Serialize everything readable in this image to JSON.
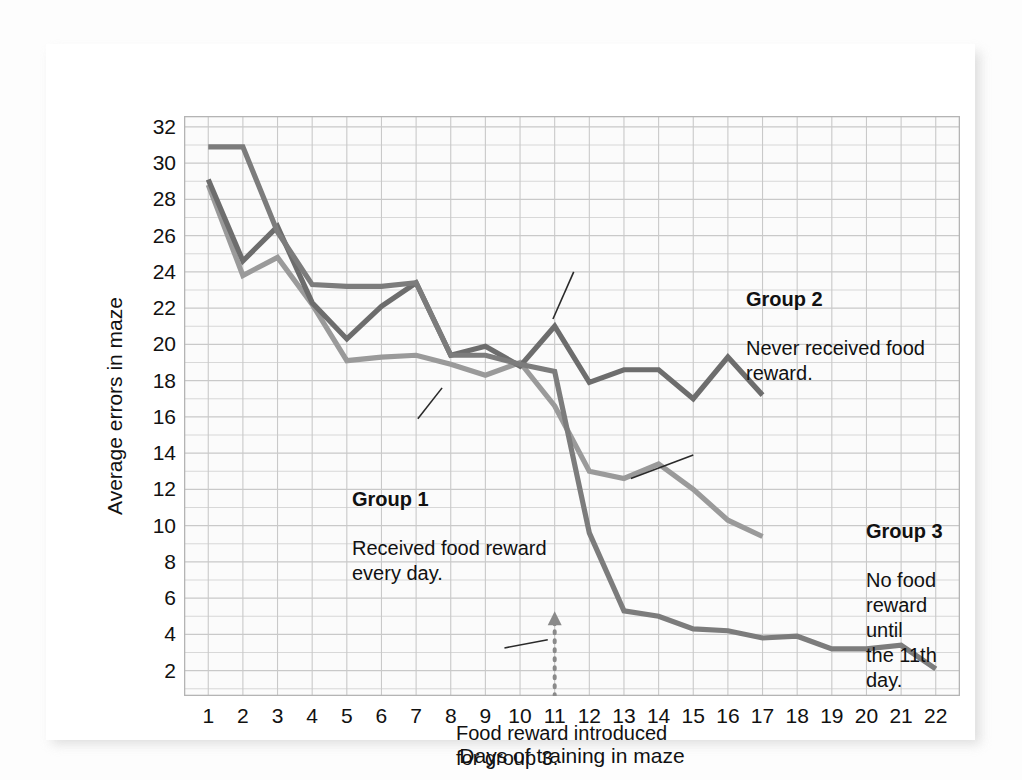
{
  "chart_data": {
    "type": "line",
    "title": "",
    "xlabel": "Days of training in maze",
    "ylabel": "Average errors in maze",
    "xlim": [
      0.3,
      22.7
    ],
    "ylim": [
      0.6,
      32.6
    ],
    "grid": true,
    "legend_position": "inline-annotations",
    "y_ticks": [
      32,
      30,
      28,
      26,
      24,
      22,
      20,
      18,
      16,
      14,
      12,
      10,
      8,
      6,
      4,
      2
    ],
    "x_ticks": [
      1,
      2,
      3,
      4,
      5,
      6,
      7,
      8,
      9,
      10,
      11,
      12,
      13,
      14,
      15,
      16,
      17,
      18,
      19,
      20,
      21,
      22
    ],
    "series": [
      {
        "name": "Group 1",
        "color": "#9a9a9a",
        "x": [
          1,
          2,
          3,
          4,
          5,
          6,
          7,
          8,
          9,
          10,
          11,
          12,
          13,
          14,
          15,
          16,
          17
        ],
        "values": [
          28.8,
          23.8,
          24.8,
          22.2,
          19.1,
          19.3,
          19.4,
          18.9,
          18.3,
          19.0,
          16.6,
          13.0,
          12.6,
          13.4,
          12.0,
          10.3,
          9.4
        ]
      },
      {
        "name": "Group 2",
        "color": "#6d6d6d",
        "x": [
          1,
          2,
          3,
          4,
          5,
          6,
          7,
          8,
          9,
          10,
          11,
          12,
          13,
          14,
          15,
          16,
          17
        ],
        "values": [
          29.1,
          24.6,
          26.5,
          22.3,
          20.3,
          22.1,
          23.4,
          19.4,
          19.9,
          18.8,
          21.0,
          17.9,
          18.6,
          18.6,
          17.0,
          19.3,
          17.2
        ]
      },
      {
        "name": "Group 3",
        "color": "#7c7c7c",
        "x": [
          1,
          2,
          3,
          4,
          5,
          6,
          7,
          8,
          9,
          10,
          11,
          12,
          13,
          14,
          15,
          16,
          17,
          18,
          19,
          20,
          21,
          22
        ],
        "values": [
          30.9,
          30.9,
          26.2,
          23.3,
          23.2,
          23.2,
          23.4,
          19.4,
          19.4,
          18.9,
          18.5,
          9.6,
          5.3,
          5.0,
          4.3,
          4.2,
          3.8,
          3.9,
          3.2,
          3.2,
          3.4,
          2.1
        ]
      }
    ],
    "annotations": [
      {
        "id": "group1",
        "title": "Group 1",
        "body": "Received food reward\nevery day."
      },
      {
        "id": "group2",
        "title": "Group 2",
        "body": "Never received food\nreward."
      },
      {
        "id": "group3",
        "title": "Group 3",
        "body": "No food reward until\nthe 11th day."
      },
      {
        "id": "food-reward",
        "title": "",
        "body": "Food reward introduced\nfor group 3."
      }
    ],
    "marker_day": 11,
    "marker_style": "dotted-vertical-arrow"
  },
  "colors": {
    "grid": "#c9c9c9",
    "plot_background": "#fbfbfb",
    "card_background": "#ffffff",
    "text": "#111111",
    "group1": "#9a9a9a",
    "group2": "#6d6d6d",
    "group3": "#7c7c7c",
    "marker": "#8a8a8a"
  },
  "axis": {
    "y_title": "Average errors in maze",
    "x_title": "Days of training in maze"
  },
  "annotations_text": {
    "g1_title": "Group 1",
    "g1_body": "Received food reward\nevery day.",
    "g2_title": "Group 2",
    "g2_body": "Never received food\nreward.",
    "g3_title": "Group 3",
    "g3_body": "No food reward until\nthe 11th day.",
    "food_body": "Food reward introduced\nfor group 3."
  }
}
